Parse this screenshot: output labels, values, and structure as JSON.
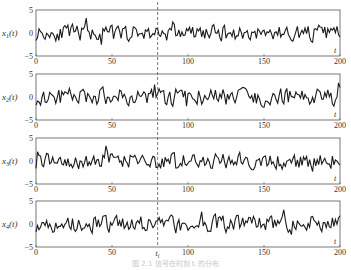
{
  "chart_data": {
    "type": "line",
    "title": "",
    "layout": "4 stacked panels sharing x axis 0–200, dashed vertical marker at t_i",
    "xlim": [
      0,
      200
    ],
    "xticks": [
      0,
      50,
      100,
      150,
      200
    ],
    "ylim": [
      -5,
      5
    ],
    "yticks": [
      -5,
      0,
      5
    ],
    "xlabel": "t",
    "marker": {
      "label": "t_i",
      "x": 80,
      "style": "dashed"
    },
    "grid": false,
    "legend": null,
    "series": [
      {
        "name": "x1(t)",
        "seed": 11,
        "amp": 1.0
      },
      {
        "name": "x2(t)",
        "seed": 23,
        "amp": 1.1
      },
      {
        "name": "x3(t)",
        "seed": 37,
        "amp": 1.0
      },
      {
        "name": "x4(t)",
        "seed": 51,
        "amp": 1.1
      }
    ]
  },
  "panels": [
    {
      "ylabel_main": "x",
      "ylabel_sub": "1",
      "ylabel_tail": "(t)"
    },
    {
      "ylabel_main": "x",
      "ylabel_sub": "2",
      "ylabel_tail": "(t)"
    },
    {
      "ylabel_main": "x",
      "ylabel_sub": "3",
      "ylabel_tail": "(t)"
    },
    {
      "ylabel_main": "x",
      "ylabel_sub": "4",
      "ylabel_tail": "(t)"
    }
  ],
  "tick_labels": {
    "x": [
      "0",
      "50",
      "100",
      "150",
      "200"
    ],
    "y_top": "5",
    "y_mid": "0",
    "y_bottom": "−5"
  },
  "axis_t": "t",
  "marker_label": "t",
  "marker_sub": "i",
  "caption": "图 2.1  信号在时刻 tᵢ 的分布"
}
